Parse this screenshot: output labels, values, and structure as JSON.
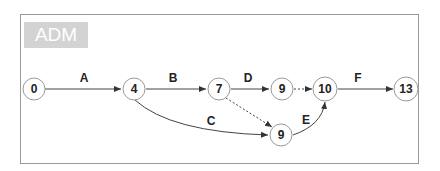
{
  "title": "ADM",
  "nodes": [
    {
      "id": "n0",
      "label": "0",
      "x": 34,
      "y": 89
    },
    {
      "id": "n4",
      "label": "4",
      "x": 134,
      "y": 89
    },
    {
      "id": "n7",
      "label": "7",
      "x": 219,
      "y": 89
    },
    {
      "id": "n9a",
      "label": "9",
      "x": 282,
      "y": 89
    },
    {
      "id": "n10",
      "label": "10",
      "x": 325,
      "y": 89
    },
    {
      "id": "n13",
      "label": "13",
      "x": 406,
      "y": 89
    },
    {
      "id": "n9b",
      "label": "9",
      "x": 281,
      "y": 135
    }
  ],
  "edges": [
    {
      "id": "A",
      "label": "A",
      "from": "n0",
      "to": "n4",
      "style": "solid"
    },
    {
      "id": "B",
      "label": "B",
      "from": "n4",
      "to": "n7",
      "style": "solid"
    },
    {
      "id": "D",
      "label": "D",
      "from": "n7",
      "to": "n9a",
      "style": "solid"
    },
    {
      "id": "dummy1",
      "label": "",
      "from": "n9a",
      "to": "n10",
      "style": "dotted"
    },
    {
      "id": "F",
      "label": "F",
      "from": "n10",
      "to": "n13",
      "style": "solid"
    },
    {
      "id": "dummy2",
      "label": "",
      "from": "n7",
      "to": "n9b",
      "style": "dotted"
    },
    {
      "id": "C",
      "label": "C",
      "from": "n4",
      "to": "n9b",
      "style": "solid-curve"
    },
    {
      "id": "E",
      "label": "E",
      "from": "n9b",
      "to": "n10",
      "style": "solid-curve"
    }
  ]
}
